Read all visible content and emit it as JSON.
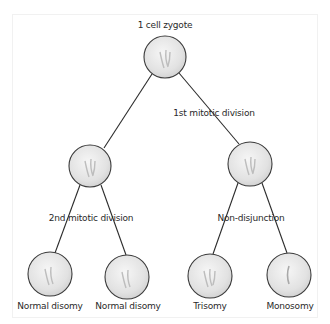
{
  "diagram": {
    "colors": {
      "line": "#2b2b2b",
      "cell_fill": "#e4e4e4",
      "cell_stroke": "#3a3a3a",
      "text": "#2a2a2a"
    },
    "nodes": [
      {
        "id": "zygote",
        "label": "1 cell zygote",
        "cx": 165,
        "cy": 57,
        "r": 21
      },
      {
        "id": "mid-left",
        "label": "",
        "cx": 90,
        "cy": 166,
        "r": 21
      },
      {
        "id": "mid-right",
        "label": "",
        "cx": 250,
        "cy": 164,
        "r": 22
      },
      {
        "id": "bottom-1",
        "label": "Normal disomy",
        "cx": 50,
        "cy": 274,
        "r": 22
      },
      {
        "id": "bottom-2",
        "label": "Normal disomy",
        "cx": 127,
        "cy": 277,
        "r": 22
      },
      {
        "id": "bottom-3",
        "label": "Trisomy",
        "cx": 210,
        "cy": 276,
        "r": 22
      },
      {
        "id": "bottom-4",
        "label": "Monosomy",
        "cx": 289,
        "cy": 275,
        "r": 22
      }
    ],
    "edge_labels": {
      "first_division": "1st mitotic division",
      "second_division": "2nd mitotic division",
      "nondisjunction": "Non-disjunction"
    },
    "labels": {
      "top": "1 cell zygote",
      "b1": "Normal disomy",
      "b2": "Normal disomy",
      "b3": "Trisomy",
      "b4": "Monosomy"
    }
  }
}
